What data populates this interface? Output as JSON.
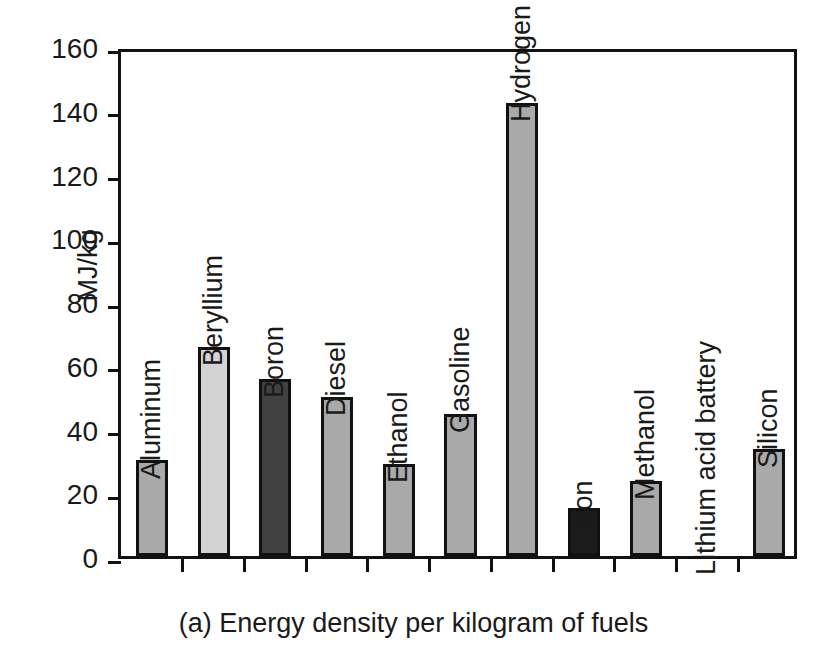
{
  "chart_data": {
    "type": "bar",
    "title": "",
    "caption": "(a) Energy density per kilogram of fuels",
    "xlabel": "",
    "ylabel": "MJ/kg",
    "ylim": [
      0,
      160
    ],
    "yticks": [
      0,
      20,
      40,
      60,
      80,
      100,
      120,
      140,
      160
    ],
    "grid": false,
    "legend": "none",
    "categories": [
      "Aluminum",
      "Beryllium",
      "Boron",
      "Diesel",
      "Ethanol",
      "Gasoline",
      "Hydrogen (l)",
      "Iron",
      "Methanol",
      "Lithium acid battery",
      "Silicon"
    ],
    "values": [
      30,
      65.5,
      55.5,
      50,
      29,
      44.5,
      142,
      15,
      23.5,
      0,
      33.5
    ],
    "bar_colors": [
      "#a9a9a9",
      "#d2d2d2",
      "#414141",
      "#a9a9a9",
      "#a9a9a9",
      "#a9a9a9",
      "#a9a9a9",
      "#1b1b1b",
      "#a9a9a9",
      "#a9a9a9",
      "#a9a9a9"
    ],
    "bar_edge_color": "#111111",
    "axis_color": "#111111",
    "background": "#ffffff"
  }
}
